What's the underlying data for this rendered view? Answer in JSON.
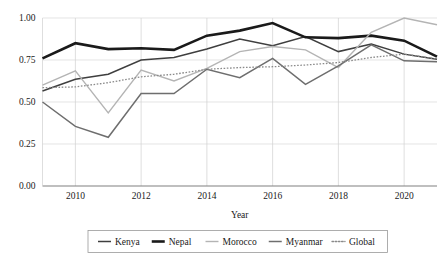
{
  "chart_data": {
    "type": "line",
    "title": "",
    "xlabel": "Year",
    "ylabel": "",
    "x": [
      2009,
      2010,
      2011,
      2012,
      2013,
      2014,
      2015,
      2016,
      2017,
      2018,
      2019,
      2020,
      2021
    ],
    "xlim": [
      2009,
      2021
    ],
    "ylim": [
      0.0,
      1.0
    ],
    "yticks": [
      "0.00",
      "0.25",
      "0.50",
      "0.75",
      "1.00"
    ],
    "ytick_values": [
      0.0,
      0.25,
      0.5,
      0.75,
      1.0
    ],
    "xticks": [
      "2010",
      "2012",
      "2014",
      "2016",
      "2018",
      "2020"
    ],
    "xtick_values": [
      2010,
      2012,
      2014,
      2016,
      2018,
      2020
    ],
    "grid": "horizontal-and-vertical",
    "legend_position": "bottom",
    "series": [
      {
        "name": "Kenya",
        "color": "#3f3f3f",
        "width": 1.5,
        "dash": "none",
        "values": [
          0.565,
          0.635,
          0.665,
          0.75,
          0.765,
          0.815,
          0.875,
          0.835,
          0.89,
          0.8,
          0.845,
          0.785,
          0.755
        ]
      },
      {
        "name": "Nepal",
        "color": "#1a1a1a",
        "width": 2.6,
        "dash": "none",
        "values": [
          0.76,
          0.85,
          0.815,
          0.82,
          0.81,
          0.895,
          0.925,
          0.97,
          0.885,
          0.88,
          0.895,
          0.865,
          0.77
        ]
      },
      {
        "name": "Morocco",
        "color": "#b4b4b4",
        "width": 1.4,
        "dash": "none",
        "values": [
          0.6,
          0.685,
          0.435,
          0.69,
          0.625,
          0.7,
          0.8,
          0.83,
          0.81,
          0.705,
          0.915,
          1.0,
          0.96
        ]
      },
      {
        "name": "Myanmar",
        "color": "#6e6e6e",
        "width": 1.5,
        "dash": "none",
        "values": [
          0.5,
          0.355,
          0.29,
          0.55,
          0.55,
          0.695,
          0.645,
          0.76,
          0.605,
          0.715,
          0.84,
          0.745,
          0.74
        ]
      },
      {
        "name": "Global",
        "color": "#8a8a8a",
        "width": 1.3,
        "dash": "dotted",
        "values": [
          0.585,
          0.59,
          0.615,
          0.65,
          0.665,
          0.695,
          0.705,
          0.71,
          0.72,
          0.735,
          0.765,
          0.785,
          0.755
        ]
      }
    ]
  },
  "legend": {
    "items": [
      {
        "label": "Kenya"
      },
      {
        "label": "Nepal"
      },
      {
        "label": "Morocco"
      },
      {
        "label": "Myanmar"
      },
      {
        "label": "Global"
      }
    ]
  }
}
